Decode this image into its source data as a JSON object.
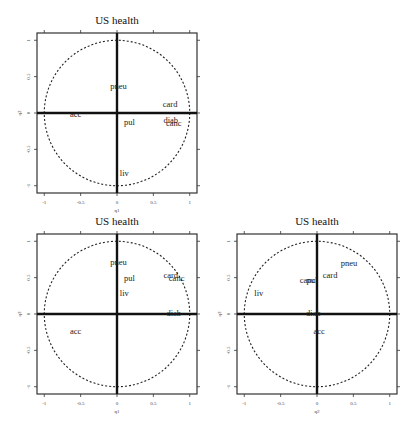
{
  "chart_data": [
    {
      "type": "scatter",
      "subtype": "correlation-circle",
      "title": "US health",
      "xlabel": "q1",
      "ylabel": "q2",
      "xlim": [
        -1.1,
        1.1
      ],
      "ylim": [
        -1.1,
        1.1
      ],
      "xticks": [
        "-1",
        "-0.5",
        "0",
        "0.5",
        "1"
      ],
      "yticks": [
        "-1",
        "-0.5",
        "0",
        "0.5",
        "1"
      ],
      "unit_circle": true,
      "points": [
        {
          "label": "pneu",
          "x": 0.02,
          "y": 0.37
        },
        {
          "label": "card",
          "x": 0.73,
          "y": 0.12
        },
        {
          "label": "acc",
          "x": -0.57,
          "y": -0.02
        },
        {
          "label": "pul",
          "x": 0.17,
          "y": -0.13
        },
        {
          "label": "diab",
          "x": 0.74,
          "y": -0.09
        },
        {
          "label": "canc",
          "x": 0.78,
          "y": -0.14
        },
        {
          "label": "liv",
          "x": 0.1,
          "y": -0.82
        }
      ]
    },
    {
      "type": "scatter",
      "subtype": "correlation-circle",
      "title": "US health",
      "xlabel": "q1",
      "ylabel": "q3",
      "xlim": [
        -1.1,
        1.1
      ],
      "ylim": [
        -1.1,
        1.1
      ],
      "xticks": [
        "-1",
        "-0.5",
        "0",
        "0.5",
        "1"
      ],
      "yticks": [
        "-1",
        "-0.5",
        "0",
        "0.5",
        "1"
      ],
      "unit_circle": true,
      "points": [
        {
          "label": "pneu",
          "x": 0.02,
          "y": 0.72
        },
        {
          "label": "pul",
          "x": 0.17,
          "y": 0.49
        },
        {
          "label": "liv",
          "x": 0.1,
          "y": 0.29
        },
        {
          "label": "card",
          "x": 0.74,
          "y": 0.54
        },
        {
          "label": "canc",
          "x": 0.82,
          "y": 0.49
        },
        {
          "label": "diab",
          "x": 0.78,
          "y": 0.02
        },
        {
          "label": "acc",
          "x": -0.57,
          "y": -0.24
        }
      ]
    },
    {
      "type": "scatter",
      "subtype": "correlation-circle",
      "title": "US health",
      "xlabel": "q2",
      "ylabel": "q3",
      "xlim": [
        -1.1,
        1.1
      ],
      "ylim": [
        -1.1,
        1.1
      ],
      "xticks": [
        "-1",
        "-0.5",
        "0",
        "0.5",
        "1"
      ],
      "yticks": [
        "-1",
        "-0.5",
        "0",
        "0.5",
        "1"
      ],
      "unit_circle": true,
      "points": [
        {
          "label": "pneu",
          "x": 0.44,
          "y": 0.7
        },
        {
          "label": "card",
          "x": 0.18,
          "y": 0.54
        },
        {
          "label": "canc",
          "x": -0.13,
          "y": 0.47
        },
        {
          "label": "pul",
          "x": -0.07,
          "y": 0.47
        },
        {
          "label": "liv",
          "x": -0.8,
          "y": 0.29
        },
        {
          "label": "diab",
          "x": -0.05,
          "y": 0.02
        },
        {
          "label": "acc",
          "x": 0.03,
          "y": -0.24
        }
      ]
    }
  ],
  "layout": {
    "panels": [
      {
        "left": 37,
        "top": 33,
        "size": 160
      },
      {
        "left": 37,
        "top": 234,
        "size": 160
      },
      {
        "left": 237,
        "top": 234,
        "size": 160
      }
    ],
    "colors": {
      "frame": "#333333",
      "axis": "#111111",
      "circle": "#222222",
      "text": "#222222"
    }
  }
}
